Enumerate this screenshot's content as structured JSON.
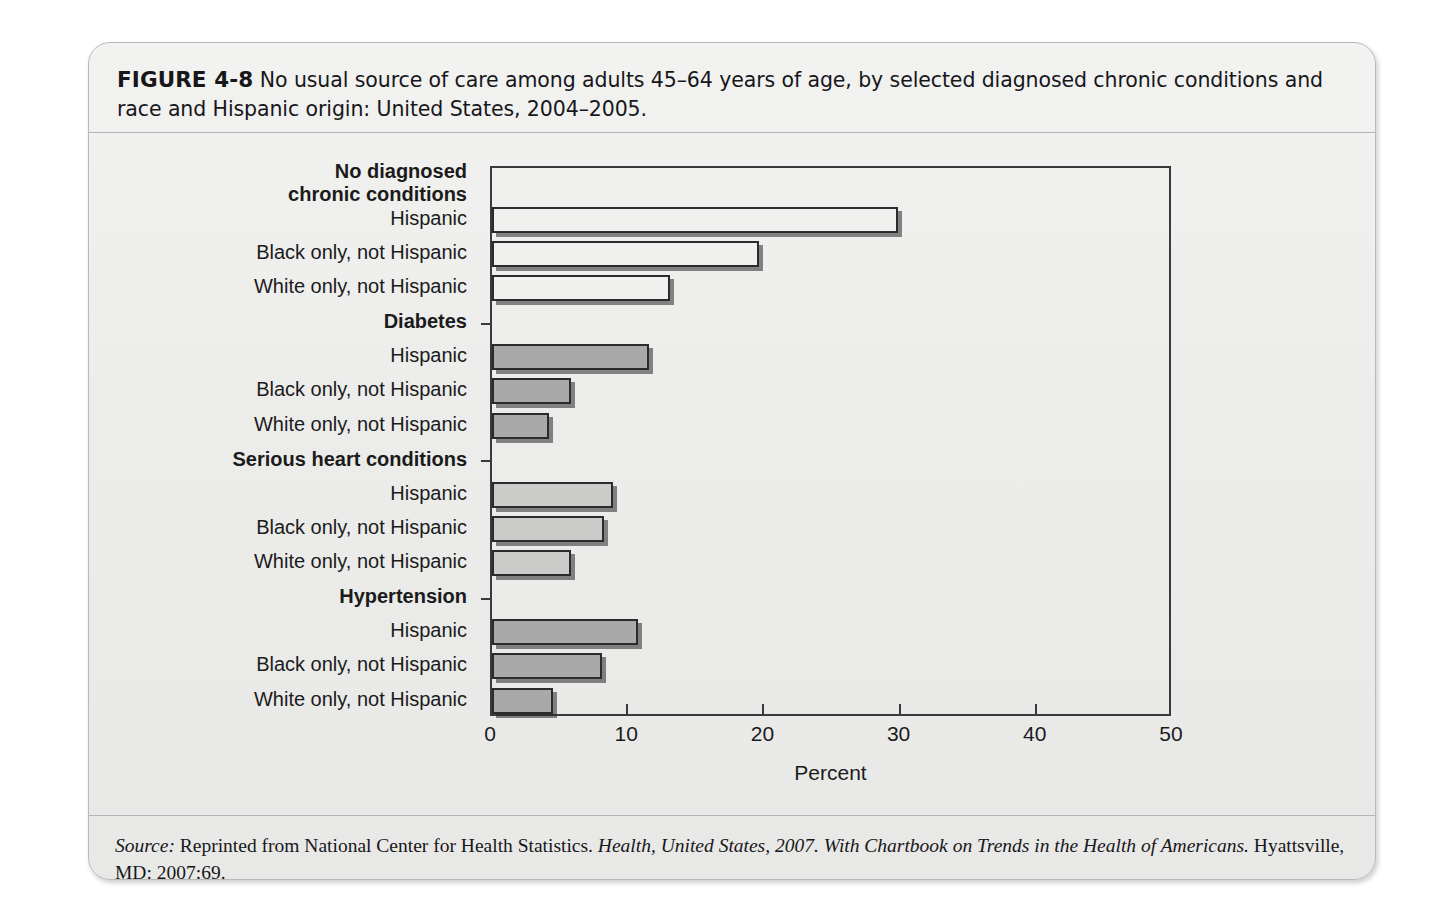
{
  "figure": {
    "label": "FIGURE 4-8",
    "caption": "No usual source of care among adults 45–64 years of age, by selected diagnosed chronic conditions and race and Hispanic origin: United States, 2004–2005.",
    "source_prefix": "Source:",
    "source_text_1": " Reprinted from National Center for Health Statistics. ",
    "source_italic_1": "Health, United States, 2007.",
    "source_text_2": " ",
    "source_italic_2": "With Chartbook on Trends in the Health of Americans.",
    "source_text_3": " Hyattsville, MD: 2007:69."
  },
  "chart_data": {
    "type": "bar",
    "orientation": "horizontal",
    "title": "No usual source of care among adults 45–64 years of age, by selected diagnosed chronic conditions and race and Hispanic origin: United States, 2004–2005.",
    "xlabel": "Percent",
    "ylabel": "",
    "xlim": [
      0,
      50
    ],
    "xticks": [
      0,
      10,
      20,
      30,
      40,
      50
    ],
    "xticklabels": [
      "0",
      "10",
      "20",
      "30",
      "40",
      "50"
    ],
    "grid": false,
    "legend": "none",
    "groups": [
      {
        "name": "No diagnosed chronic conditions",
        "name_lines": [
          "No diagnosed",
          "chronic conditions"
        ],
        "fill": "#f0f0ee",
        "categories": [
          "Hispanic",
          "Black only, not Hispanic",
          "White only, not Hispanic"
        ],
        "values": [
          29.8,
          19.6,
          13.1
        ]
      },
      {
        "name": "Diabetes",
        "name_lines": [
          "Diabetes"
        ],
        "fill": "#a9a9a9",
        "categories": [
          "Hispanic",
          "Black only, not Hispanic",
          "White only, not Hispanic"
        ],
        "values": [
          11.5,
          5.8,
          4.2
        ]
      },
      {
        "name": "Serious heart conditions",
        "name_lines": [
          "Serious heart conditions"
        ],
        "fill": "#cbcbc9",
        "categories": [
          "Hispanic",
          "Black only, not Hispanic",
          "White only, not Hispanic"
        ],
        "values": [
          8.9,
          8.2,
          5.8
        ]
      },
      {
        "name": "Hypertension",
        "name_lines": [
          "Hypertension"
        ],
        "fill": "#a9a9a9",
        "categories": [
          "Hispanic",
          "Black only, not Hispanic",
          "White only, not Hispanic"
        ],
        "values": [
          10.7,
          8.1,
          4.5
        ]
      }
    ]
  }
}
